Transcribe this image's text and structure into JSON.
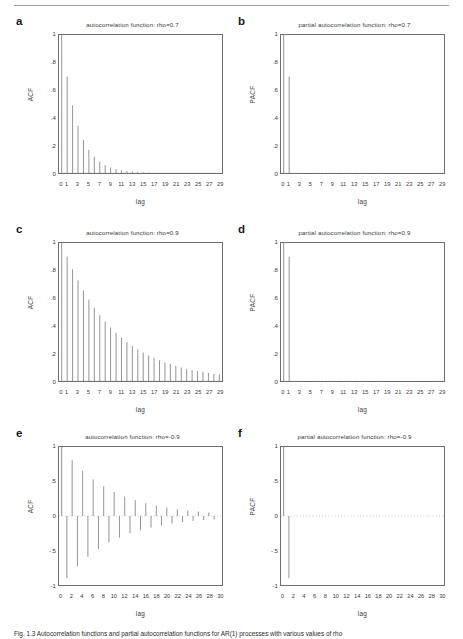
{
  "figure": {
    "caption": "Fig. 1.3 Autocorrelation functions and partial autocorrelation functions for AR(1) processes with various values of rho",
    "background": "#ffffff",
    "spike_color": "#8c8c8c",
    "axis_color": "#6e6e6e",
    "zero_line_color": "#b0b0b0"
  },
  "panels": [
    {
      "letter": "a",
      "name": "acf-rho-0.7",
      "title": "autocorrelation function: rho=0.7",
      "ylabel": "ACF",
      "xlabel": "lag",
      "chart_data": {
        "type": "bar",
        "title": "autocorrelation function: rho=0.7",
        "xlabel": "lag",
        "ylabel": "ACF",
        "xlim": [
          -0.5,
          29.5
        ],
        "ylim": [
          0,
          1
        ],
        "yticks": [
          "0",
          ".2",
          ".4",
          ".6",
          ".8",
          "1"
        ],
        "ytick_values": [
          0,
          0.2,
          0.4,
          0.6,
          0.8,
          1
        ],
        "xticks": [
          "0",
          "1",
          "3",
          "5",
          "7",
          "9",
          "11",
          "13",
          "15",
          "17",
          "19",
          "21",
          "23",
          "25",
          "27",
          "29"
        ],
        "xtick_values": [
          0,
          1,
          3,
          5,
          7,
          9,
          11,
          13,
          15,
          17,
          19,
          21,
          23,
          25,
          27,
          29
        ],
        "zero_line": false,
        "grid": false,
        "x": [
          0,
          1,
          2,
          3,
          4,
          5,
          6,
          7,
          8,
          9,
          10,
          11,
          12,
          13,
          14,
          15,
          16,
          17,
          18,
          19,
          20,
          21,
          22,
          23,
          24,
          25,
          26,
          27,
          28,
          29
        ],
        "values": [
          1,
          0.7,
          0.49,
          0.343,
          0.24,
          0.168,
          0.118,
          0.082,
          0.058,
          0.04,
          0.028,
          0.02,
          0.014,
          0.0097,
          0.0068,
          0.0047,
          0.0033,
          0.0023,
          0.0016,
          0.0011,
          0.0008,
          0.0006,
          0.0004,
          0.0003,
          0.0002,
          0.00014,
          0.0001,
          7e-05,
          5e-05,
          3e-05
        ]
      }
    },
    {
      "letter": "b",
      "name": "pacf-rho-0.7",
      "title": "partial autocorrelation function: rho=0.7",
      "ylabel": "PACF",
      "xlabel": "lag",
      "chart_data": {
        "type": "bar",
        "title": "partial autocorrelation function: rho=0.7",
        "xlabel": "lag",
        "ylabel": "PACF",
        "xlim": [
          -0.5,
          29.5
        ],
        "ylim": [
          0,
          1
        ],
        "yticks": [
          "0",
          ".2",
          ".4",
          ".6",
          ".8",
          "1"
        ],
        "ytick_values": [
          0,
          0.2,
          0.4,
          0.6,
          0.8,
          1
        ],
        "xticks": [
          "0",
          "1",
          "3",
          "5",
          "7",
          "9",
          "11",
          "13",
          "15",
          "17",
          "19",
          "21",
          "23",
          "25",
          "27",
          "29"
        ],
        "xtick_values": [
          0,
          1,
          3,
          5,
          7,
          9,
          11,
          13,
          15,
          17,
          19,
          21,
          23,
          25,
          27,
          29
        ],
        "zero_line": true,
        "grid": false,
        "x": [
          0,
          1,
          2,
          3,
          4,
          5,
          6,
          7,
          8,
          9,
          10,
          11,
          12,
          13,
          14,
          15,
          16,
          17,
          18,
          19,
          20,
          21,
          22,
          23,
          24,
          25,
          26,
          27,
          28,
          29
        ],
        "values": [
          1,
          0.7,
          0,
          0,
          0,
          0,
          0,
          0,
          0,
          0,
          0,
          0,
          0,
          0,
          0,
          0,
          0,
          0,
          0,
          0,
          0,
          0,
          0,
          0,
          0,
          0,
          0,
          0,
          0,
          0
        ]
      }
    },
    {
      "letter": "c",
      "name": "acf-rho-0.9",
      "title": "autocorrelation function: rho=0.9",
      "ylabel": "ACF",
      "xlabel": "lag",
      "chart_data": {
        "type": "bar",
        "title": "autocorrelation function: rho=0.9",
        "xlabel": "lag",
        "ylabel": "ACF",
        "xlim": [
          -0.5,
          29.5
        ],
        "ylim": [
          0,
          1
        ],
        "yticks": [
          "0",
          ".2",
          ".4",
          ".6",
          ".8",
          "1"
        ],
        "ytick_values": [
          0,
          0.2,
          0.4,
          0.6,
          0.8,
          1
        ],
        "xticks": [
          "0",
          "1",
          "3",
          "5",
          "7",
          "9",
          "11",
          "13",
          "15",
          "17",
          "19",
          "21",
          "23",
          "25",
          "27",
          "29"
        ],
        "xtick_values": [
          0,
          1,
          3,
          5,
          7,
          9,
          11,
          13,
          15,
          17,
          19,
          21,
          23,
          25,
          27,
          29
        ],
        "zero_line": false,
        "grid": false,
        "x": [
          0,
          1,
          2,
          3,
          4,
          5,
          6,
          7,
          8,
          9,
          10,
          11,
          12,
          13,
          14,
          15,
          16,
          17,
          18,
          19,
          20,
          21,
          22,
          23,
          24,
          25,
          26,
          27,
          28,
          29
        ],
        "values": [
          1,
          0.9,
          0.81,
          0.729,
          0.656,
          0.59,
          0.531,
          0.478,
          0.43,
          0.387,
          0.349,
          0.314,
          0.282,
          0.254,
          0.229,
          0.206,
          0.185,
          0.167,
          0.15,
          0.135,
          0.122,
          0.109,
          0.098,
          0.089,
          0.08,
          0.072,
          0.065,
          0.058,
          0.052,
          0.047
        ]
      }
    },
    {
      "letter": "d",
      "name": "pacf-rho-0.9",
      "title": "partial autocorrelation function: rho=0.9",
      "ylabel": "PACF",
      "xlabel": "lag",
      "chart_data": {
        "type": "bar",
        "title": "partial autocorrelation function: rho=0.9",
        "xlabel": "lag",
        "ylabel": "PACF",
        "xlim": [
          -0.5,
          29.5
        ],
        "ylim": [
          0,
          1
        ],
        "yticks": [
          "0",
          ".2",
          ".4",
          ".6",
          ".8",
          "1"
        ],
        "ytick_values": [
          0,
          0.2,
          0.4,
          0.6,
          0.8,
          1
        ],
        "xticks": [
          "0",
          "1",
          "3",
          "5",
          "7",
          "9",
          "11",
          "13",
          "15",
          "17",
          "19",
          "21",
          "23",
          "25",
          "27",
          "29"
        ],
        "xtick_values": [
          0,
          1,
          3,
          5,
          7,
          9,
          11,
          13,
          15,
          17,
          19,
          21,
          23,
          25,
          27,
          29
        ],
        "zero_line": true,
        "grid": false,
        "x": [
          0,
          1,
          2,
          3,
          4,
          5,
          6,
          7,
          8,
          9,
          10,
          11,
          12,
          13,
          14,
          15,
          16,
          17,
          18,
          19,
          20,
          21,
          22,
          23,
          24,
          25,
          26,
          27,
          28,
          29
        ],
        "values": [
          1,
          0.9,
          0,
          0,
          0,
          0,
          0,
          0,
          0,
          0,
          0,
          0,
          0,
          0,
          0,
          0,
          0,
          0,
          0,
          0,
          0,
          0,
          0,
          0,
          0,
          0,
          0,
          0,
          0,
          0
        ]
      }
    },
    {
      "letter": "e",
      "name": "acf-rho-neg-0.9",
      "title": "autocorrelation function: rho=-0.9",
      "ylabel": "ACF",
      "xlabel": "lag",
      "chart_data": {
        "type": "bar",
        "title": "autocorrelation function: rho=-0.9",
        "xlabel": "lag",
        "ylabel": "ACF",
        "xlim": [
          -0.5,
          30.5
        ],
        "ylim": [
          -1,
          1
        ],
        "yticks": [
          "-1",
          "-.5",
          "0",
          ".5",
          "1"
        ],
        "ytick_values": [
          -1,
          -0.5,
          0,
          0.5,
          1
        ],
        "xticks": [
          "0",
          "2",
          "4",
          "6",
          "8",
          "10",
          "12",
          "14",
          "16",
          "18",
          "20",
          "22",
          "24",
          "26",
          "28",
          "30"
        ],
        "xtick_values": [
          0,
          2,
          4,
          6,
          8,
          10,
          12,
          14,
          16,
          18,
          20,
          22,
          24,
          26,
          28,
          30
        ],
        "zero_line": true,
        "grid": false,
        "x": [
          0,
          1,
          2,
          3,
          4,
          5,
          6,
          7,
          8,
          9,
          10,
          11,
          12,
          13,
          14,
          15,
          16,
          17,
          18,
          19,
          20,
          21,
          22,
          23,
          24,
          25,
          26,
          27,
          28,
          29
        ],
        "values": [
          1,
          -0.9,
          0.81,
          -0.729,
          0.656,
          -0.59,
          0.531,
          -0.478,
          0.43,
          -0.387,
          0.349,
          -0.314,
          0.282,
          -0.254,
          0.229,
          -0.206,
          0.185,
          -0.167,
          0.15,
          -0.135,
          0.122,
          -0.109,
          0.098,
          -0.089,
          0.08,
          -0.072,
          0.065,
          -0.058,
          0.052,
          -0.047
        ]
      }
    },
    {
      "letter": "f",
      "name": "pacf-rho-neg-0.9",
      "title": "partial autocorrelation function: rho=-0.9",
      "ylabel": "PACF",
      "xlabel": "lag",
      "chart_data": {
        "type": "bar",
        "title": "partial autocorrelation function: rho=-0.9",
        "xlabel": "lag",
        "ylabel": "PACF",
        "xlim": [
          -0.5,
          30.5
        ],
        "ylim": [
          -1,
          1
        ],
        "yticks": [
          "-1",
          "-.5",
          "0",
          ".5",
          "1"
        ],
        "ytick_values": [
          -1,
          -0.5,
          0,
          0.5,
          1
        ],
        "xticks": [
          "0",
          "2",
          "4",
          "6",
          "8",
          "10",
          "12",
          "14",
          "16",
          "18",
          "20",
          "22",
          "24",
          "26",
          "28",
          "30"
        ],
        "xtick_values": [
          0,
          2,
          4,
          6,
          8,
          10,
          12,
          14,
          16,
          18,
          20,
          22,
          24,
          26,
          28,
          30
        ],
        "zero_line": true,
        "grid": false,
        "x": [
          0,
          1,
          2,
          3,
          4,
          5,
          6,
          7,
          8,
          9,
          10,
          11,
          12,
          13,
          14,
          15,
          16,
          17,
          18,
          19,
          20,
          21,
          22,
          23,
          24,
          25,
          26,
          27,
          28,
          29
        ],
        "values": [
          1,
          -0.9,
          0,
          0,
          0,
          0,
          0,
          0,
          0,
          0,
          0,
          0,
          0,
          0,
          0,
          0,
          0,
          0,
          0,
          0,
          0,
          0,
          0,
          0,
          0,
          0,
          0,
          0,
          0,
          0
        ]
      }
    }
  ]
}
